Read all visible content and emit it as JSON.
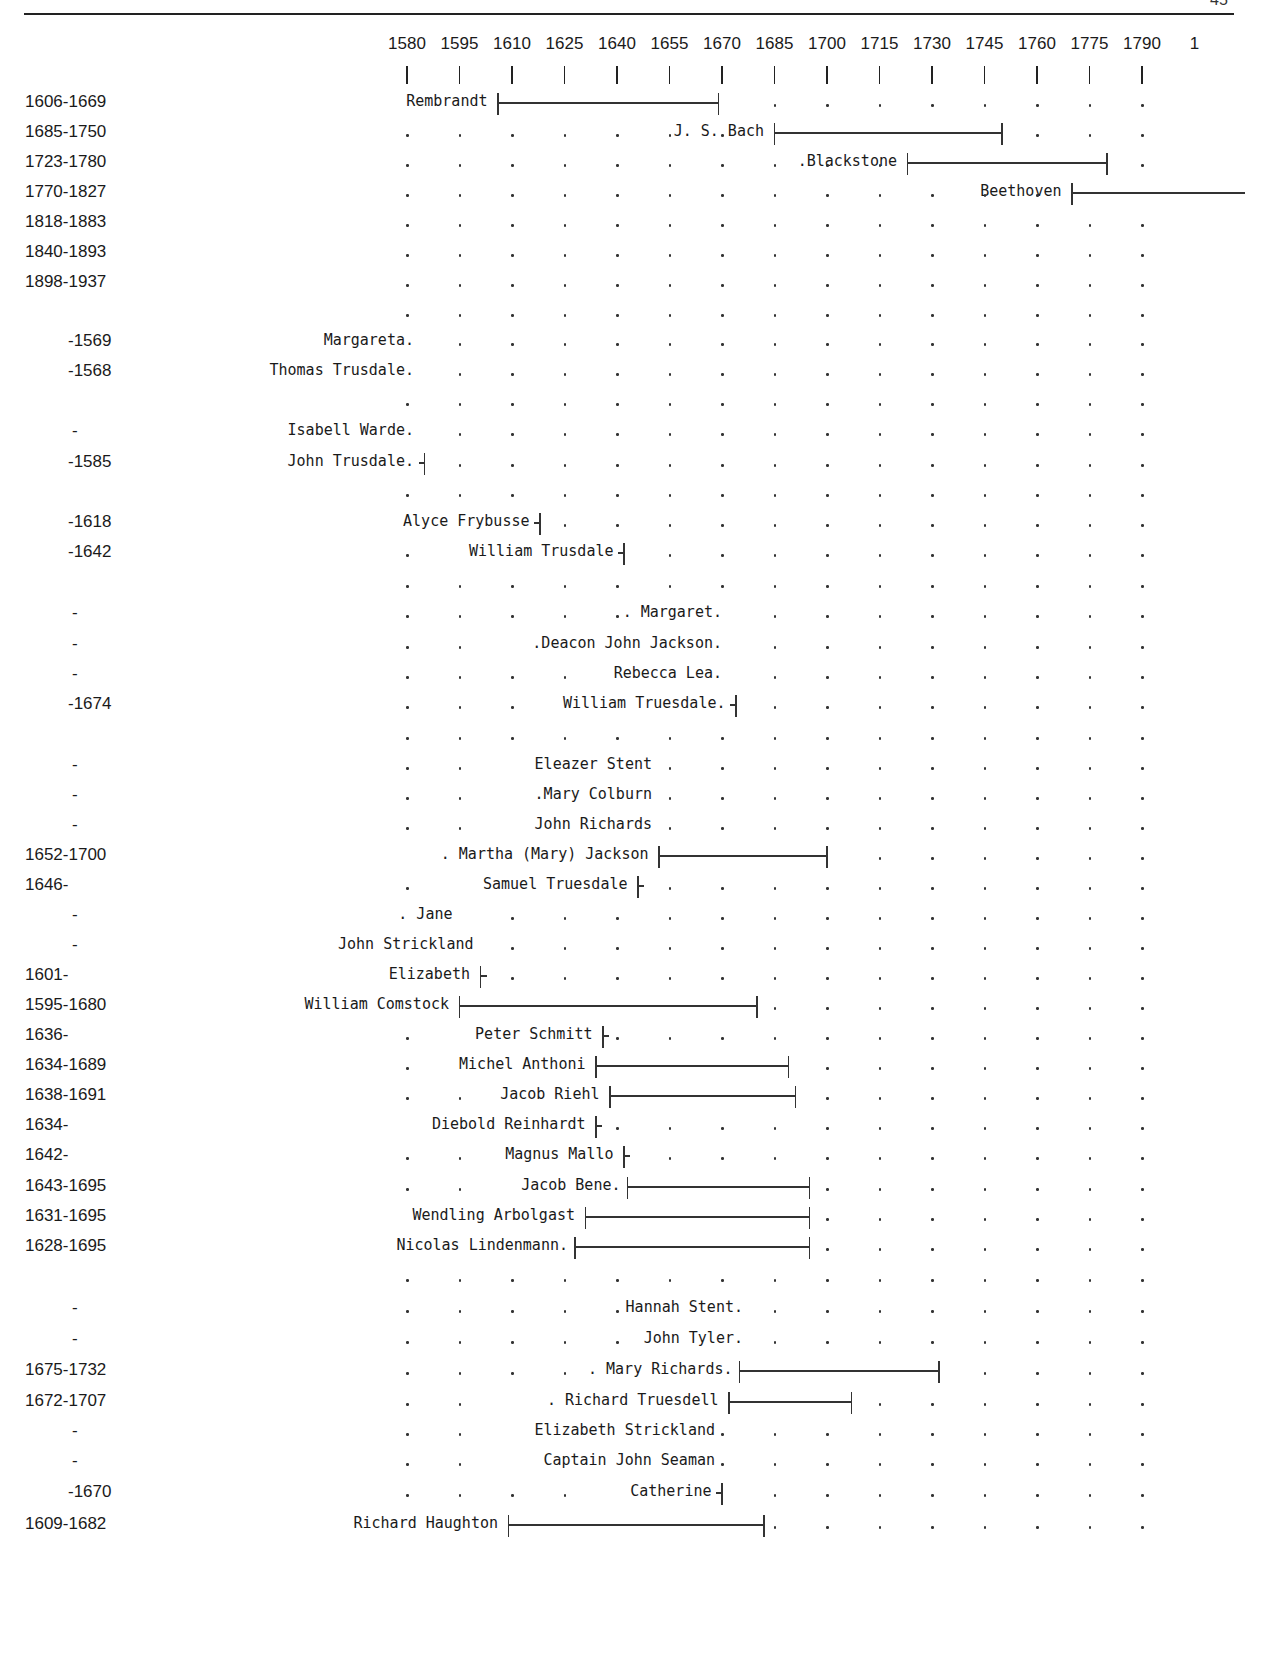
{
  "page": {
    "running_header": "",
    "page_number": "45"
  },
  "chart_data": {
    "type": "timeline",
    "title": "",
    "axis": {
      "start": 1580,
      "step": 15,
      "ticks": [
        1580,
        1595,
        1610,
        1625,
        1640,
        1655,
        1670,
        1685,
        1700,
        1715,
        1730,
        1745,
        1760,
        1775,
        1790
      ],
      "tick_labels": [
        "1580",
        "1595",
        "1610",
        "1625",
        "1640",
        "1655",
        "1670",
        "1685",
        "1700",
        "1715",
        "1730",
        "1745",
        "1760",
        "1775",
        "1790",
        "1"
      ],
      "px_origin": 407,
      "px_per_year": 3.5
    },
    "rows": [
      {
        "years": "1606-1669",
        "name": "Rembrandt",
        "start": 1606,
        "end": 1669,
        "y": 103,
        "label_end": 1603,
        "dots_from": 1685
      },
      {
        "years": "1685-1750",
        "name": "J. S. Bach",
        "start": 1685,
        "end": 1750,
        "y": 133,
        "label_end": 1682,
        "dots_from": 1580
      },
      {
        "years": "1723-1780",
        "name": ".Blackstone",
        "start": 1723,
        "end": 1780,
        "y": 163,
        "label_end": 1720,
        "dots_from": 1580
      },
      {
        "years": "1770-1827",
        "name": "Beethoven",
        "start": 1770,
        "end": 1827,
        "y": 193,
        "label_end": 1767,
        "dots_from": 1580
      },
      {
        "years": "1818-1883",
        "name": "",
        "y": 223,
        "dots_from": 1580
      },
      {
        "years": "1840-1893",
        "name": "",
        "y": 253,
        "dots_from": 1580
      },
      {
        "years": "1898-1937",
        "name": "",
        "y": 283,
        "dots_from": 1580
      },
      {
        "years": "",
        "name": "",
        "y": 313,
        "dots_from": 1580
      },
      {
        "years": "-1569",
        "name": "Margareta.",
        "y": 342,
        "label_end": 1582,
        "dots_from": 1595
      },
      {
        "years": "-1568",
        "name": "Thomas Trusdale.",
        "y": 372,
        "label_end": 1582,
        "dots_from": 1595
      },
      {
        "years": "",
        "name": "",
        "y": 402,
        "dots_from": 1580
      },
      {
        "years": "-",
        "name": "Isabell Warde.",
        "y": 432,
        "label_end": 1582,
        "dots_from": 1595
      },
      {
        "years": "-1585",
        "name": "John Trusdale.",
        "end": 1585,
        "y": 463,
        "label_end": 1582,
        "dots_from": 1595
      },
      {
        "years": "",
        "name": "",
        "y": 493,
        "dots_from": 1580
      },
      {
        "years": "-1618",
        "name": "Alyce Frybusse",
        "end": 1618,
        "y": 523,
        "label_end": 1615,
        "dots_from": 1625
      },
      {
        "years": "-1642",
        "name": "William Trusdale",
        "end": 1642,
        "y": 553,
        "label_end": 1639,
        "dots_from": 1655,
        "pre_dots": [
          1580
        ]
      },
      {
        "years": "",
        "name": "",
        "y": 584,
        "dots_from": 1580
      },
      {
        "years": "-",
        "name": ". Margaret.",
        "y": 614,
        "label_end": 1670,
        "dots_from": 1685,
        "pre_dots": [
          1580,
          1595,
          1610,
          1625,
          1640
        ]
      },
      {
        "years": "-",
        "name": ".Deacon John Jackson.",
        "y": 645,
        "label_end": 1670,
        "dots_from": 1685,
        "pre_dots": [
          1580,
          1595
        ]
      },
      {
        "years": "-",
        "name": "Rebecca Lea.",
        "y": 675,
        "label_end": 1670,
        "dots_from": 1685,
        "pre_dots": [
          1580,
          1595,
          1610,
          1625
        ]
      },
      {
        "years": "-1674",
        "name": "William Truesdale.",
        "end": 1674,
        "y": 705,
        "label_end": 1671,
        "dots_from": 1685,
        "pre_dots": [
          1580,
          1595,
          1610
        ]
      },
      {
        "years": "",
        "name": "",
        "y": 736,
        "dots_from": 1580
      },
      {
        "years": "-",
        "name": "Eleazer Stent",
        "y": 766,
        "label_end": 1650,
        "dots_from": 1655,
        "pre_dots": [
          1580,
          1595
        ]
      },
      {
        "years": "-",
        "name": ".Mary Colburn",
        "y": 796,
        "label_end": 1650,
        "dots_from": 1655,
        "pre_dots": [
          1580,
          1595
        ]
      },
      {
        "years": "-",
        "name": "John Richards",
        "y": 826,
        "label_end": 1650,
        "dots_from": 1655,
        "pre_dots": [
          1580,
          1595
        ]
      },
      {
        "years": "1652-1700",
        "name": ". Martha (Mary) Jackson",
        "start": 1652,
        "end": 1700,
        "y": 856,
        "label_end": 1649,
        "dots_from": 1715
      },
      {
        "years": "1646-",
        "name": "Samuel Truesdale",
        "start": 1646,
        "y": 886,
        "label_end": 1643,
        "dots_from": 1655,
        "pre_dots": [
          1580
        ]
      },
      {
        "years": "-",
        "name": ". Jane",
        "y": 916,
        "label_end": 1593,
        "dots_from": 1610
      },
      {
        "years": "-",
        "name": "John Strickland",
        "y": 946,
        "label_end": 1599,
        "dots_from": 1610
      },
      {
        "years": "1601-",
        "name": "Elizabeth",
        "start": 1601,
        "y": 976,
        "label_end": 1598,
        "dots_from": 1610
      },
      {
        "years": "1595-1680",
        "name": "William Comstock",
        "start": 1595,
        "end": 1680,
        "y": 1006,
        "label_end": 1592,
        "dots_from": 1685
      },
      {
        "years": "1636-",
        "name": "Peter Schmitt",
        "start": 1636,
        "y": 1036,
        "label_end": 1633,
        "dots_from": 1640,
        "pre_dots": [
          1580
        ]
      },
      {
        "years": "1634-1689",
        "name": "Michel Anthoni",
        "start": 1634,
        "end": 1689,
        "y": 1066,
        "label_end": 1631,
        "dots_from": 1700,
        "pre_dots": [
          1580
        ]
      },
      {
        "years": "1638-1691",
        "name": "Jacob Riehl",
        "start": 1638,
        "end": 1691,
        "y": 1096,
        "label_end": 1635,
        "dots_from": 1700,
        "pre_dots": [
          1580,
          1595
        ]
      },
      {
        "years": "1634-",
        "name": "Diebold Reinhardt",
        "start": 1634,
        "y": 1126,
        "label_end": 1631,
        "dots_from": 1640
      },
      {
        "years": "1642-",
        "name": "Magnus Mallo",
        "start": 1642,
        "y": 1156,
        "label_end": 1639,
        "dots_from": 1655,
        "pre_dots": [
          1580,
          1595
        ]
      },
      {
        "years": "1643-1695",
        "name": "Jacob Bene.",
        "start": 1643,
        "end": 1695,
        "y": 1187,
        "label_end": 1641,
        "dots_from": 1700,
        "pre_dots": [
          1580,
          1595
        ]
      },
      {
        "years": "1631-1695",
        "name": "Wendling Arbolgast",
        "start": 1631,
        "end": 1695,
        "y": 1217,
        "label_end": 1628,
        "dots_from": 1700
      },
      {
        "years": "1628-1695",
        "name": "Nicolas Lindenmann.",
        "start": 1628,
        "end": 1695,
        "y": 1247,
        "label_end": 1626,
        "dots_from": 1700
      },
      {
        "years": "",
        "name": "",
        "y": 1278,
        "dots_from": 1580
      },
      {
        "years": "-",
        "name": "Hannah Stent.",
        "y": 1309,
        "label_end": 1676,
        "dots_from": 1685,
        "pre_dots": [
          1580,
          1595,
          1610,
          1625,
          1640
        ]
      },
      {
        "years": "-",
        "name": "John Tyler.",
        "y": 1340,
        "label_end": 1676,
        "dots_from": 1685,
        "pre_dots": [
          1580,
          1595,
          1610,
          1625,
          1640
        ]
      },
      {
        "years": "1675-1732",
        "name": ". Mary Richards.",
        "start": 1675,
        "end": 1732,
        "y": 1371,
        "label_end": 1673,
        "dots_from": 1745,
        "pre_dots": [
          1580,
          1595,
          1610,
          1625
        ]
      },
      {
        "years": "1672-1707",
        "name": ". Richard Truesdell",
        "start": 1672,
        "end": 1707,
        "y": 1402,
        "label_end": 1669,
        "dots_from": 1715,
        "pre_dots": [
          1580,
          1595
        ]
      },
      {
        "years": "-",
        "name": "Elizabeth Strickland",
        "y": 1432,
        "label_end": 1668,
        "dots_from": 1670,
        "pre_dots": [
          1580,
          1595
        ]
      },
      {
        "years": "-",
        "name": "Captain John Seaman",
        "y": 1462,
        "label_end": 1668,
        "dots_from": 1670,
        "pre_dots": [
          1580,
          1595
        ]
      },
      {
        "years": "-1670",
        "name": "Catherine",
        "end": 1670,
        "y": 1493,
        "label_end": 1667,
        "dots_from": 1685,
        "pre_dots": [
          1580,
          1595,
          1610,
          1625
        ]
      },
      {
        "years": "1609-1682",
        "name": "Richard Haughton",
        "start": 1609,
        "end": 1682,
        "y": 1525,
        "label_end": 1606,
        "dots_from": 1685
      }
    ]
  }
}
